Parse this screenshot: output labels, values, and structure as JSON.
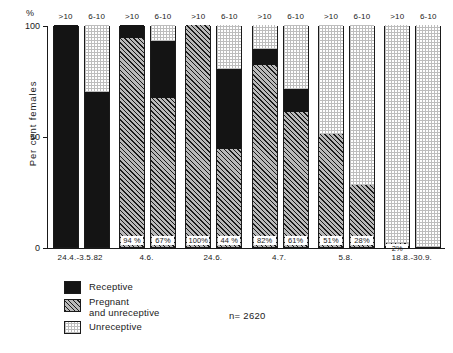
{
  "chart_data": {
    "type": "bar",
    "title": "",
    "subtitle": "",
    "xlabel": "",
    "ylabel": "Per cent females",
    "yunit": "%",
    "ylim": [
      0,
      100
    ],
    "yticks": [
      "100",
      "50",
      "0"
    ],
    "ytick_values": [
      100,
      50,
      0
    ],
    "grid": false,
    "stacked": true,
    "normalized_percent": true,
    "legend_position": "bottom-left",
    "annotation": "n= 2620",
    "legend": [
      {
        "name": "Receptive",
        "key": "receptive",
        "pattern": "solid-black"
      },
      {
        "name": "Pregnant and unreceptive",
        "key": "pregnant",
        "pattern": "diagonal-hatch"
      },
      {
        "name": "Unreceptive",
        "key": "unreceptive",
        "pattern": "fine-dotted-grid"
      }
    ],
    "series": [
      {
        "name": "Receptive",
        "key": "receptive"
      },
      {
        "name": "Pregnant and unreceptive",
        "key": "pregnant"
      },
      {
        "name": "Unreceptive",
        "key": "unreceptive"
      }
    ],
    "categories": [
      "24.4.-3.5.82",
      "4.6.",
      "24.6.",
      "4.7.",
      "5.8.",
      "18.8.-30.9."
    ],
    "subcategories": [
      ">10",
      "6-10"
    ],
    "groups": [
      {
        "label": "24.4.-3.5.82",
        "bars": [
          {
            "cap": ">10",
            "segments": [
              {
                "key": "pregnant",
                "value": 0,
                "label": ""
              },
              {
                "key": "receptive",
                "value": 100,
                "label": ""
              },
              {
                "key": "unreceptive",
                "value": 0,
                "label": ""
              }
            ]
          },
          {
            "cap": "6-10",
            "segments": [
              {
                "key": "pregnant",
                "value": 0,
                "label": ""
              },
              {
                "key": "receptive",
                "value": 70,
                "label": ""
              },
              {
                "key": "unreceptive",
                "value": 30,
                "label": ""
              }
            ]
          }
        ]
      },
      {
        "label": "4.6.",
        "bars": [
          {
            "cap": ">10",
            "segments": [
              {
                "key": "pregnant",
                "value": 94,
                "label": "94 %"
              },
              {
                "key": "receptive",
                "value": 6,
                "label": ""
              },
              {
                "key": "unreceptive",
                "value": 0,
                "label": ""
              }
            ]
          },
          {
            "cap": "6-10",
            "segments": [
              {
                "key": "pregnant",
                "value": 67,
                "label": "67%"
              },
              {
                "key": "receptive",
                "value": 26,
                "label": ""
              },
              {
                "key": "unreceptive",
                "value": 7,
                "label": ""
              }
            ]
          }
        ]
      },
      {
        "label": "24.6.",
        "bars": [
          {
            "cap": ">10",
            "segments": [
              {
                "key": "pregnant",
                "value": 100,
                "label": "100%"
              },
              {
                "key": "receptive",
                "value": 0,
                "label": ""
              },
              {
                "key": "unreceptive",
                "value": 0,
                "label": ""
              }
            ]
          },
          {
            "cap": "6-10",
            "segments": [
              {
                "key": "pregnant",
                "value": 44,
                "label": "44 %"
              },
              {
                "key": "receptive",
                "value": 36,
                "label": ""
              },
              {
                "key": "unreceptive",
                "value": 20,
                "label": ""
              }
            ]
          }
        ]
      },
      {
        "label": "4.7.",
        "bars": [
          {
            "cap": ">10",
            "segments": [
              {
                "key": "pregnant",
                "value": 82,
                "label": "82%"
              },
              {
                "key": "receptive",
                "value": 7,
                "label": ""
              },
              {
                "key": "unreceptive",
                "value": 11,
                "label": ""
              }
            ]
          },
          {
            "cap": "6-10",
            "segments": [
              {
                "key": "pregnant",
                "value": 61,
                "label": "61%"
              },
              {
                "key": "receptive",
                "value": 10,
                "label": ""
              },
              {
                "key": "unreceptive",
                "value": 29,
                "label": ""
              }
            ]
          }
        ]
      },
      {
        "label": "5.8.",
        "bars": [
          {
            "cap": ">10",
            "segments": [
              {
                "key": "pregnant",
                "value": 51,
                "label": "51%"
              },
              {
                "key": "receptive",
                "value": 0,
                "label": ""
              },
              {
                "key": "unreceptive",
                "value": 49,
                "label": ""
              }
            ]
          },
          {
            "cap": "6-10",
            "segments": [
              {
                "key": "pregnant",
                "value": 28,
                "label": "28%"
              },
              {
                "key": "receptive",
                "value": 0,
                "label": ""
              },
              {
                "key": "unreceptive",
                "value": 72,
                "label": ""
              }
            ]
          }
        ]
      },
      {
        "label": "18.8.-30.9.",
        "bars": [
          {
            "cap": ">10",
            "segments": [
              {
                "key": "pregnant",
                "value": 2,
                "label": "2%"
              },
              {
                "key": "receptive",
                "value": 0,
                "label": ""
              },
              {
                "key": "unreceptive",
                "value": 98,
                "label": ""
              }
            ]
          },
          {
            "cap": "6-10",
            "segments": [
              {
                "key": "pregnant",
                "value": 0,
                "label": ""
              },
              {
                "key": "receptive",
                "value": 0,
                "label": ""
              },
              {
                "key": "unreceptive",
                "value": 100,
                "label": ""
              }
            ]
          }
        ]
      }
    ]
  },
  "colors": {
    "ink": "#1a1a1a",
    "receptive": "#141414",
    "pregnant": "#b9b9b9",
    "unreceptive": "#ffffff",
    "background": "#ffffff"
  }
}
